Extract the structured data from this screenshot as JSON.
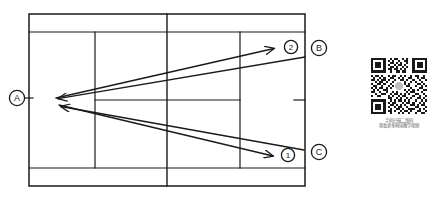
{
  "diagram": {
    "court": {
      "stroke_color": "#1a1a1a",
      "background_color": "#ffffff",
      "left": 29,
      "right": 305,
      "top": 14,
      "bottom": 186,
      "singles_top": 32,
      "singles_bottom": 168,
      "net_x": 167,
      "service_line_left_x": 95,
      "service_line_right_x": 240,
      "center_service_y": 100
    },
    "position_markers": [
      {
        "id": "A",
        "label": "A",
        "cx": 17,
        "cy": 98,
        "tick": true
      },
      {
        "id": "B",
        "label": "B",
        "cx": 319,
        "cy": 48,
        "tick": false
      },
      {
        "id": "C",
        "label": "C",
        "cx": 319,
        "cy": 152,
        "tick": false
      }
    ],
    "shot_markers": [
      {
        "id": "1",
        "label": "1",
        "cx": 288,
        "cy": 155
      },
      {
        "id": "2",
        "label": "2",
        "cx": 291,
        "cy": 47
      }
    ],
    "arrows": [
      {
        "name": "shot-to-corner-2",
        "from_label": "A",
        "to_label": "2",
        "x1": 56,
        "y1": 98,
        "x2": 278,
        "y2": 48,
        "arrowhead": "end"
      },
      {
        "name": "return-from-b",
        "from_label": "B",
        "to_label": "A",
        "x1": 305,
        "y1": 57,
        "x2": 54,
        "y2": 99,
        "arrowhead": "end"
      },
      {
        "name": "shot-to-corner-1",
        "from_label": "A",
        "to_label": "1",
        "x1": 59,
        "y1": 105,
        "x2": 277,
        "y2": 157,
        "arrowhead": "end"
      },
      {
        "name": "return-from-c",
        "from_label": "C",
        "to_label": "A",
        "x1": 304,
        "y1": 150,
        "x2": 57,
        "y2": 107,
        "arrowhead": "end"
      }
    ]
  },
  "qr_panel": {
    "name": "qr-code-promo",
    "caption_line1": "手机扫描二维码",
    "caption_line2": "观看更多网球教学视频",
    "caption_color": "#6a6a6a",
    "module_color": "#1a1a1a"
  }
}
